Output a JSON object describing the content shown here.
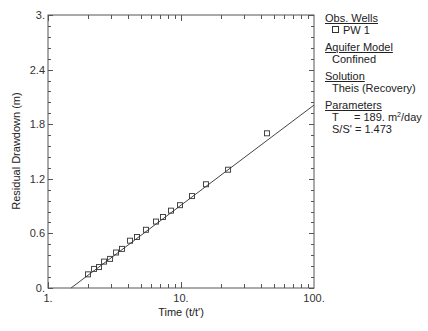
{
  "chart_data": {
    "type": "scatter",
    "title": "",
    "xlabel": "Time (t/t')",
    "ylabel": "Residual Drawdown (m)",
    "xscale": "log",
    "xlim": [
      1,
      100
    ],
    "ylim": [
      0,
      3.0
    ],
    "x_tick_labels": [
      "1.",
      "10.",
      "100."
    ],
    "y_tick_labels": [
      "0.",
      "0.6",
      "1.2",
      "1.8",
      "2.4",
      "3."
    ],
    "y_ticks": [
      0,
      0.6,
      1.2,
      1.8,
      2.4,
      3.0
    ],
    "y_minor_step": 0.12,
    "grid": false,
    "series": [
      {
        "name": "PW 1",
        "marker": "open-square",
        "x": [
          2.0,
          2.22,
          2.42,
          2.64,
          2.93,
          3.25,
          3.6,
          4.14,
          4.67,
          5.45,
          6.49,
          7.32,
          8.41,
          9.82,
          12.1,
          15.4,
          22.6,
          44.3
        ],
        "y": [
          0.15,
          0.21,
          0.23,
          0.29,
          0.32,
          0.39,
          0.43,
          0.52,
          0.56,
          0.64,
          0.73,
          0.78,
          0.85,
          0.91,
          1.01,
          1.14,
          1.3,
          1.7
        ]
      },
      {
        "name": "Theis (Recovery) fit",
        "type": "line",
        "x": [
          1.49,
          100
        ],
        "y": [
          0.0,
          2.01
        ]
      }
    ],
    "legend_position": "right"
  },
  "legend": {
    "obs_wells_header": "Obs. Wells",
    "obs_well": "PW 1",
    "aquifer_header": "Aquifer Model",
    "aquifer_value": "Confined",
    "solution_header": "Solution",
    "solution_value": "Theis (Recovery)",
    "parameters_header": "Parameters",
    "param_T_label": "T",
    "param_T_value": "= 189. m",
    "param_T_unit_exp": "2",
    "param_T_unit_tail": "/day",
    "param_S_label": "S/S'",
    "param_S_value": "= 1.473"
  }
}
